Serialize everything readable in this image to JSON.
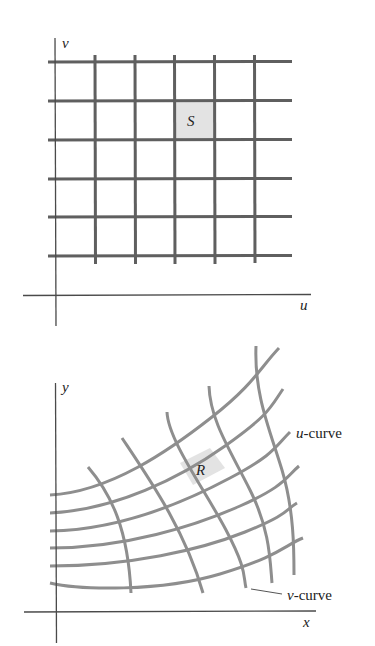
{
  "figure": {
    "top_panel": {
      "axis_labels": {
        "vertical": "v",
        "horizontal": "u"
      },
      "region_label": "S",
      "grid": {
        "horizontal_lines": 6,
        "vertical_lines": 5
      }
    },
    "bottom_panel": {
      "axis_labels": {
        "vertical": "y",
        "horizontal": "x"
      },
      "region_label": "R",
      "annotations": {
        "u_curve": {
          "var": "u",
          "suffix": "-curve"
        },
        "v_curve": {
          "var": "v",
          "suffix": "-curve"
        }
      },
      "grid": {
        "u_curves": 6,
        "v_curves": 5
      }
    },
    "colors": {
      "axis": "#4a4a4a",
      "top_grid": "#5f5f5f",
      "bottom_grid": "#8e8e8e",
      "shaded_region": "#e3e3e3",
      "text": "#222222"
    }
  }
}
